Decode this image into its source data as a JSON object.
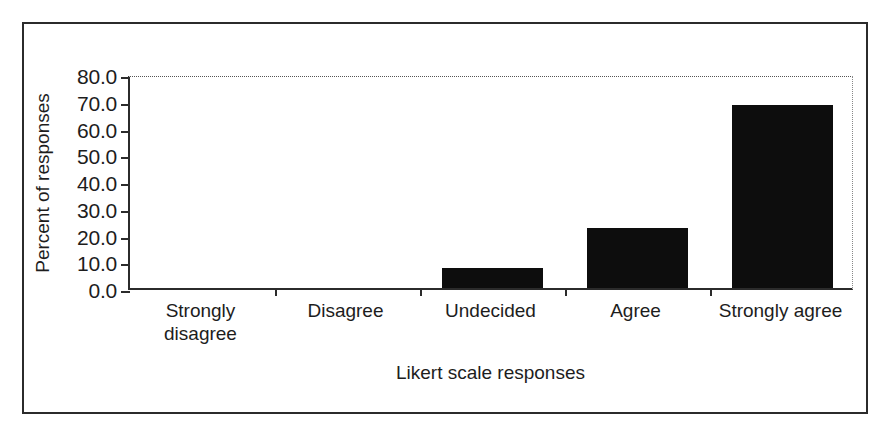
{
  "chart_data": {
    "type": "bar",
    "title": "",
    "subtitle": "",
    "xlabel": "Likert scale responses",
    "ylabel": "Percent of responses",
    "categories": [
      "Strongly\ndisagree",
      "Disagree",
      "Undecided",
      "Agree",
      "Strongly agree"
    ],
    "values": [
      0.0,
      0.0,
      7.5,
      22.5,
      68.5
    ],
    "ylim": [
      0.0,
      80.0
    ],
    "ytick_labels": [
      "80.0",
      "70.0",
      "60.0",
      "50.0",
      "40.0",
      "30.0",
      "20.0",
      "10.0",
      "0.0"
    ],
    "ytick_values": [
      80.0,
      70.0,
      60.0,
      50.0,
      40.0,
      30.0,
      20.0,
      10.0,
      0.0
    ],
    "grid": false,
    "top_gridline": true,
    "legend": "none",
    "bar_color": "#0d0d0d",
    "axis_color": "#2b2b2b",
    "background_color": "#ffffff"
  }
}
